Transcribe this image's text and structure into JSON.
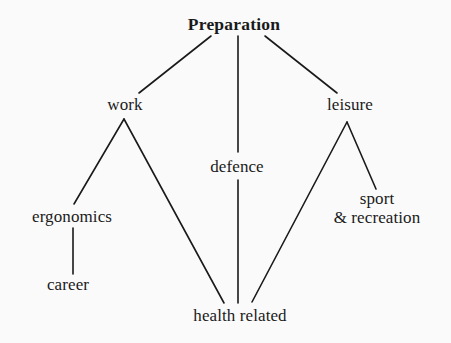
{
  "diagram": {
    "title": "Preparation",
    "background_color": "#fafafa",
    "line_color": "#1a1a1a",
    "text_color": "#1a1a1a",
    "nodes": [
      {
        "id": "preparation",
        "label": "Preparation",
        "x": 234,
        "y": 25,
        "bold": true
      },
      {
        "id": "work",
        "label": "work",
        "x": 125,
        "y": 105,
        "bold": false
      },
      {
        "id": "defence",
        "label": "defence",
        "x": 237,
        "y": 167,
        "bold": false
      },
      {
        "id": "leisure",
        "label": "leisure",
        "x": 350,
        "y": 105,
        "bold": false
      },
      {
        "id": "ergonomics",
        "label": "ergonomics",
        "x": 72,
        "y": 217,
        "bold": false
      },
      {
        "id": "career",
        "label": "career",
        "x": 68,
        "y": 285,
        "bold": false
      },
      {
        "id": "sport-recreation",
        "label": "sport",
        "label_line2": "& recreation",
        "x": 377,
        "y": 208,
        "bold": false
      },
      {
        "id": "health-related",
        "label": "health related",
        "x": 240,
        "y": 316,
        "bold": false
      }
    ],
    "edges": [
      {
        "from": "preparation",
        "to": "work",
        "x1": 211,
        "y1": 36,
        "x2": 139,
        "y2": 93
      },
      {
        "from": "preparation",
        "to": "defence",
        "x1": 238,
        "y1": 36,
        "x2": 238,
        "y2": 152
      },
      {
        "from": "preparation",
        "to": "leisure",
        "x1": 265,
        "y1": 36,
        "x2": 337,
        "y2": 93
      },
      {
        "from": "work",
        "to": "ergonomics",
        "x1": 124,
        "y1": 119,
        "x2": 74,
        "y2": 204
      },
      {
        "from": "work",
        "to": "health-related",
        "x1": 124,
        "y1": 119,
        "x2": 224,
        "y2": 303
      },
      {
        "from": "ergonomics",
        "to": "career",
        "x1": 73,
        "y1": 228,
        "x2": 73,
        "y2": 274
      },
      {
        "from": "defence",
        "to": "health-related",
        "x1": 238,
        "y1": 180,
        "x2": 238,
        "y2": 303
      },
      {
        "from": "leisure",
        "to": "health-related",
        "x1": 347,
        "y1": 122,
        "x2": 252,
        "y2": 302
      },
      {
        "from": "leisure",
        "to": "sport-recreation",
        "x1": 347,
        "y1": 122,
        "x2": 376,
        "y2": 189
      }
    ]
  }
}
